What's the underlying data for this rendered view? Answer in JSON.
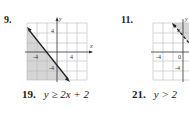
{
  "problems": [
    {
      "number": "9.",
      "graph": {
        "x_label": "x",
        "y_label": "y",
        "ticks": {
          "x_neg": "-4",
          "x_pos": "4",
          "y_pos": "4",
          "y_neg": "-4"
        },
        "shaded": "below-left of decreasing line"
      }
    },
    {
      "number": "11.",
      "graph": {
        "y_label": "y",
        "ticks": {
          "x_neg": "-4",
          "origin": "0",
          "y_pos": "4",
          "y_neg": "-4"
        },
        "shaded": "above, dashed line"
      }
    }
  ],
  "equations": [
    {
      "number": "19.",
      "text": "y ≥ 2x + 2"
    },
    {
      "number": "21.",
      "text": "y > 2"
    }
  ]
}
